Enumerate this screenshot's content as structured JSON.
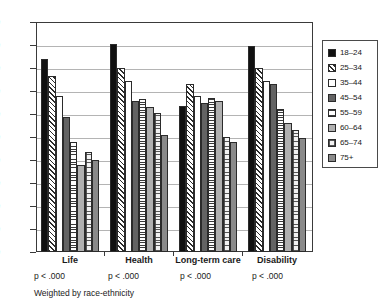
{
  "chart_data": {
    "type": "bar",
    "title": "",
    "xlabel": "",
    "ylabel": "",
    "ylim": [
      0,
      100
    ],
    "ytick_step": 10,
    "yticks": [
      "100",
      "90",
      "80",
      "70",
      "60",
      "50",
      "40",
      "30",
      "20",
      "10",
      "0"
    ],
    "grid": true,
    "legend_position": "right-outside",
    "categories": [
      "Life",
      "Health",
      "Long-term care",
      "Disability"
    ],
    "series": [
      {
        "name": "18–24",
        "pattern": "solid-black",
        "values": [
          84.0,
          90.5,
          63.5,
          89.5
        ]
      },
      {
        "name": "25–34",
        "pattern": "diagonal-hatch",
        "values": [
          76.5,
          80.0,
          73.0,
          80.0
        ]
      },
      {
        "name": "35–44",
        "pattern": "white",
        "values": [
          68.0,
          74.5,
          68.0,
          74.5
        ]
      },
      {
        "name": "45–54",
        "pattern": "solid-dark-gray",
        "values": [
          58.5,
          65.5,
          65.0,
          73.0
        ]
      },
      {
        "name": "55–59",
        "pattern": "horizontal-lines",
        "values": [
          48.0,
          66.5,
          67.0,
          62.0
        ]
      },
      {
        "name": "60–64",
        "pattern": "solid-light-gray",
        "values": [
          38.0,
          63.0,
          65.5,
          56.0
        ]
      },
      {
        "name": "65–74",
        "pattern": "stipple-grid",
        "values": [
          43.5,
          60.5,
          50.0,
          53.0
        ]
      },
      {
        "name": "75+",
        "pattern": "solid-mid-gray",
        "values": [
          40.0,
          51.0,
          48.0,
          49.5
        ]
      }
    ],
    "annotations": {
      "p_values": [
        "p < .000",
        "p < .000",
        "p < .000",
        "p < .000"
      ],
      "footnote": "Weighted by race-ethnicity"
    },
    "colors": {
      "axis": "#3a3a3a",
      "gridline": "#b4b4b4",
      "background": "#ffffff",
      "text": "#1a1a1a"
    }
  },
  "legend": {
    "items": [
      {
        "label": "18–24"
      },
      {
        "label": "25–34"
      },
      {
        "label": "35–44"
      },
      {
        "label": "45–54"
      },
      {
        "label": "55–59"
      },
      {
        "label": "60–64"
      },
      {
        "label": "65–74"
      },
      {
        "label": "75+"
      }
    ]
  }
}
